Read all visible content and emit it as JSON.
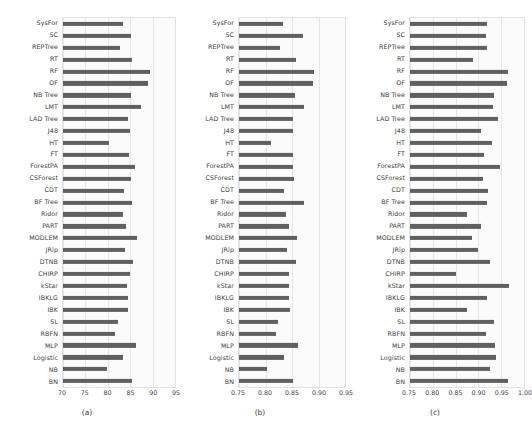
{
  "figure": {
    "background": "#ffffff",
    "bar_color": "#606060",
    "grid_color": "#e6e6e6",
    "axes_background": "#fbfbfb",
    "text_color": "#3b3b3b"
  },
  "categories": [
    "SysFor",
    "SC",
    "REPTree",
    "RT",
    "RF",
    "OF",
    "NB Tree",
    "LMT",
    "LAD Tree",
    "J48",
    "HT",
    "FT",
    "ForestPA",
    "CSForest",
    "CDT",
    "BF Tree",
    "Ridor",
    "PART",
    "MODLEM",
    "JRip",
    "DTNB",
    "CHIRP",
    "kStar",
    "IBKLG",
    "IBK",
    "SL",
    "RBFN",
    "MLP",
    "Logistic",
    "NB",
    "BN"
  ],
  "chart_data": [
    {
      "type": "bar",
      "orientation": "horizontal",
      "panel_label": "(a)",
      "title": "",
      "xlabel": "",
      "ylabel": "",
      "xlim": [
        70,
        95
      ],
      "xticks": [
        70,
        75,
        80,
        85,
        90,
        95
      ],
      "xtick_labels": [
        "70",
        "75",
        "80",
        "85",
        "90",
        "95"
      ],
      "grid": true,
      "legend": "none",
      "categories": [
        "SysFor",
        "SC",
        "REPTree",
        "RT",
        "RF",
        "OF",
        "NB Tree",
        "LMT",
        "LAD Tree",
        "J48",
        "HT",
        "FT",
        "ForestPA",
        "CSForest",
        "CDT",
        "BF Tree",
        "Ridor",
        "PART",
        "MODLEM",
        "JRip",
        "DTNB",
        "CHIRP",
        "kStar",
        "IBKLG",
        "IBK",
        "SL",
        "RBFN",
        "MLP",
        "Logistic",
        "NB",
        "BN"
      ],
      "values": [
        83.3,
        85.2,
        82.7,
        85.4,
        89.5,
        89.0,
        85.2,
        87.3,
        84.6,
        84.9,
        80.2,
        84.7,
        86.0,
        85.2,
        83.7,
        85.3,
        83.5,
        84.1,
        86.5,
        83.9,
        85.6,
        85.0,
        84.3,
        84.4,
        84.4,
        82.2,
        81.7,
        86.2,
        83.4,
        79.8,
        85.3
      ]
    },
    {
      "type": "bar",
      "orientation": "horizontal",
      "panel_label": "(b)",
      "title": "",
      "xlabel": "",
      "ylabel": "",
      "xlim": [
        0.75,
        0.95
      ],
      "xticks": [
        0.75,
        0.8,
        0.85,
        0.9,
        0.95
      ],
      "xtick_labels": [
        "0.75",
        "0.80",
        "0.85",
        "0.90",
        "0.95"
      ],
      "grid": true,
      "legend": "none",
      "categories": [
        "SysFor",
        "SC",
        "REPTree",
        "RT",
        "RF",
        "OF",
        "NB Tree",
        "LMT",
        "LAD Tree",
        "J48",
        "HT",
        "FT",
        "ForestPA",
        "CSForest",
        "CDT",
        "BF Tree",
        "Ridor",
        "PART",
        "MODLEM",
        "JRip",
        "DTNB",
        "CHIRP",
        "kStar",
        "IBKLG",
        "IBK",
        "SL",
        "RBFN",
        "MLP",
        "Logistic",
        "NB",
        "BN"
      ],
      "values": [
        0.833,
        0.871,
        0.828,
        0.857,
        0.891,
        0.889,
        0.855,
        0.872,
        0.851,
        0.851,
        0.81,
        0.852,
        0.852,
        0.853,
        0.834,
        0.873,
        0.838,
        0.845,
        0.86,
        0.841,
        0.857,
        0.845,
        0.844,
        0.845,
        0.847,
        0.823,
        0.819,
        0.861,
        0.834,
        0.803,
        0.852
      ]
    },
    {
      "type": "bar",
      "orientation": "horizontal",
      "panel_label": "(c)",
      "title": "",
      "xlabel": "",
      "ylabel": "",
      "xlim": [
        0.75,
        1.0
      ],
      "xticks": [
        0.75,
        0.8,
        0.85,
        0.9,
        0.95,
        1.0
      ],
      "xtick_labels": [
        "0.75",
        "0.80",
        "0.85",
        "0.90",
        "0.95",
        "1.00"
      ],
      "grid": true,
      "legend": "none",
      "categories": [
        "SysFor",
        "SC",
        "REPTree",
        "RT",
        "RF",
        "OF",
        "NB Tree",
        "LMT",
        "LAD Tree",
        "J48",
        "HT",
        "FT",
        "ForestPA",
        "CSForest",
        "CDT",
        "BF Tree",
        "Ridor",
        "PART",
        "MODLEM",
        "JRip",
        "DTNB",
        "CHIRP",
        "kStar",
        "IBKLG",
        "IBK",
        "SL",
        "RBFN",
        "MLP",
        "Logistic",
        "NB",
        "BN"
      ],
      "values": [
        0.918,
        0.916,
        0.919,
        0.888,
        0.966,
        0.963,
        0.934,
        0.933,
        0.944,
        0.905,
        0.929,
        0.913,
        0.948,
        0.909,
        0.92,
        0.918,
        0.874,
        0.906,
        0.886,
        0.899,
        0.926,
        0.851,
        0.968,
        0.918,
        0.874,
        0.935,
        0.917,
        0.936,
        0.938,
        0.926,
        0.964
      ]
    }
  ]
}
